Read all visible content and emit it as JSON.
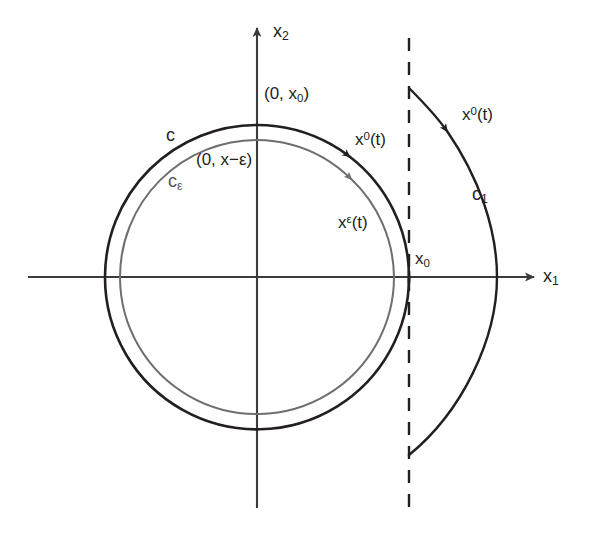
{
  "figure": {
    "background_color": "#ffffff",
    "width": 599,
    "height": 540
  },
  "colors": {
    "ink": "#231f20",
    "gray_curve": "#6d6e71",
    "axis": "#3b3b3d",
    "dashed": "#231f20"
  },
  "axes": {
    "horizontal": {
      "name": "x1-axis",
      "label": "x",
      "subscript": "1"
    },
    "vertical": {
      "name": "x2-axis",
      "label": "x",
      "subscript": "2"
    }
  },
  "labels": {
    "origin_point_top": "(0, x₀)",
    "inner_point_top": "(0, x−ε)",
    "outer_curve": "c",
    "inner_curve": "cε",
    "right_curve": "c₁",
    "trajectory_outer": "x⁰(t)",
    "trajectory_inner": "xε(t)",
    "trajectory_right": "x⁰(t)",
    "x0_point": "x₀"
  },
  "label_parts": {
    "point_top_prefix": "(0, x",
    "point_top_sub": "0",
    "point_top_suffix": ")",
    "inner_top_prefix": "(0, x−ε",
    "inner_top_suffix": ")",
    "traj_base": "x",
    "traj_sup_outer": "0",
    "traj_sup_inner": "ε",
    "traj_tail": "(t)",
    "curve_c": "c",
    "curve_c_sub_eps": "ε",
    "curve_c_sub_1": "1",
    "x_base": "x",
    "x_sub_0": "0",
    "x_sub_1": "1",
    "x_sub_2": "2"
  },
  "geometry": {
    "center": {
      "x": 257,
      "y": 277
    },
    "outer_radius": 152,
    "inner_radius": 137,
    "dashed_line_x": 409,
    "dashed_line_top": 38,
    "dashed_line_bottom": 512,
    "right_arc_top": {
      "x": 409,
      "y": 88
    },
    "right_arc_bottom": {
      "x": 409,
      "y": 455
    },
    "right_arc_apex_x": 497
  }
}
